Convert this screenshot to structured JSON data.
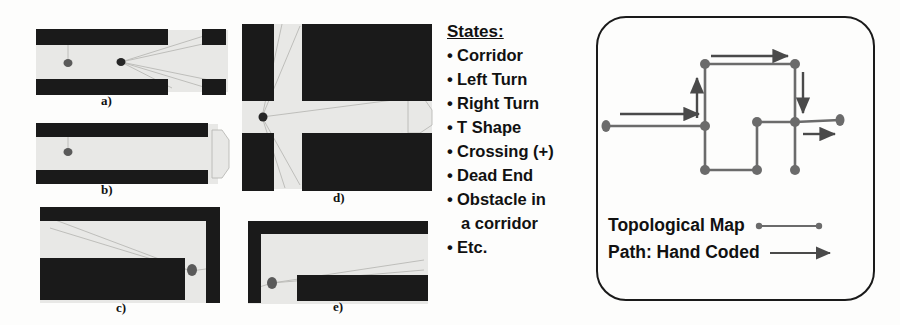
{
  "colors": {
    "wall": "#1a1a1a",
    "free_space": "#e8e8e6",
    "sonar_ray": "#b9b9b6",
    "robot": "#5a5a5a",
    "node": "#6b6b6b",
    "edge": "#6b6b6b",
    "arrow": "#4a4a4a",
    "panel_border": "#1a1a1a",
    "text": "#111111",
    "background": "#fdfdfc"
  },
  "sonar_panel": {
    "name": "corridor-state-examples",
    "figures": [
      {
        "id": "a",
        "label": "a)",
        "description": "corridor with opening / obstacle"
      },
      {
        "id": "b",
        "label": "b)",
        "description": "dead end corridor"
      },
      {
        "id": "c",
        "label": "c)",
        "description": "right turn"
      },
      {
        "id": "d",
        "label": "d)",
        "description": "crossing (+)"
      },
      {
        "id": "e",
        "label": "e)",
        "description": "left turn"
      }
    ]
  },
  "states": {
    "title": "States:",
    "items": [
      {
        "text": "Corridor",
        "continuation": false
      },
      {
        "text": "Left Turn",
        "continuation": false
      },
      {
        "text": "Right Turn",
        "continuation": false
      },
      {
        "text": "T Shape",
        "continuation": false
      },
      {
        "text": "Crossing (+)",
        "continuation": false
      },
      {
        "text": "Dead End",
        "continuation": false
      },
      {
        "text": "Obstacle in",
        "continuation": false
      },
      {
        "text": "a corridor",
        "continuation": true
      },
      {
        "text": "Etc.",
        "continuation": false
      }
    ],
    "bullet": "•"
  },
  "map_panel": {
    "name": "topological-map-panel",
    "legend": [
      {
        "label": "Topological Map",
        "symbol": "line-with-end-dots"
      },
      {
        "label": "Path: Hand Coded",
        "symbol": "arrow"
      }
    ],
    "graph": {
      "nodes": [
        {
          "id": "n_left",
          "x": 8,
          "y": 108
        },
        {
          "id": "n_junction",
          "x": 107,
          "y": 108
        },
        {
          "id": "n_topleft",
          "x": 107,
          "y": 46
        },
        {
          "id": "n_topright",
          "x": 197,
          "y": 46
        },
        {
          "id": "n_midleft",
          "x": 159,
          "y": 104
        },
        {
          "id": "n_midmid",
          "x": 197,
          "y": 104
        },
        {
          "id": "n_midright",
          "x": 242,
          "y": 102
        },
        {
          "id": "n_botleft",
          "x": 107,
          "y": 152
        },
        {
          "id": "n_botmid",
          "x": 159,
          "y": 152
        },
        {
          "id": "n_botright",
          "x": 197,
          "y": 152
        }
      ],
      "edges": [
        [
          "n_left",
          "n_junction"
        ],
        [
          "n_junction",
          "n_topleft"
        ],
        [
          "n_topleft",
          "n_topright"
        ],
        [
          "n_topright",
          "n_midmid"
        ],
        [
          "n_junction",
          "n_botleft"
        ],
        [
          "n_botleft",
          "n_botmid"
        ],
        [
          "n_botmid",
          "n_midleft"
        ],
        [
          "n_midleft",
          "n_midmid"
        ],
        [
          "n_midmid",
          "n_midright"
        ],
        [
          "n_midmid",
          "n_botright"
        ]
      ],
      "path_arrows": [
        {
          "from": [
            22,
            96
          ],
          "to": [
            104,
            96
          ],
          "direction": "right"
        },
        {
          "from": [
            99,
            100
          ],
          "to": [
            99,
            58
          ],
          "direction": "up"
        },
        {
          "from": [
            113,
            38
          ],
          "to": [
            193,
            38
          ],
          "direction": "right"
        },
        {
          "from": [
            205,
            54
          ],
          "to": [
            205,
            98
          ],
          "direction": "down"
        },
        {
          "from": [
            205,
            116
          ],
          "to": [
            240,
            116
          ],
          "direction": "right"
        }
      ]
    }
  }
}
